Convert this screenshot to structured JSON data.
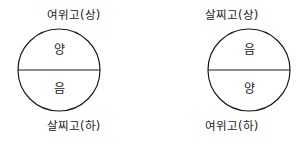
{
  "figure": {
    "background_color": "#ffffff",
    "stroke_color": "#1a1a1a",
    "text_color": "#1a1a1a",
    "diagrams": [
      {
        "name": "left-diagram",
        "top_caption": "여위고(상)",
        "upper_half_label": "양",
        "lower_half_label": "음",
        "bottom_caption": "살찌고(하)"
      },
      {
        "name": "right-diagram",
        "top_caption": "살찌고(상)",
        "upper_half_label": "음",
        "lower_half_label": "양",
        "bottom_caption": "여위고(하)"
      }
    ]
  }
}
